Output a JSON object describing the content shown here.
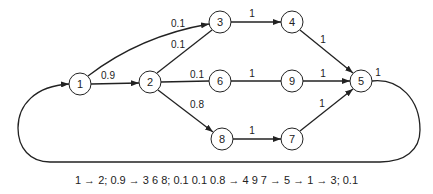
{
  "diagram": {
    "nodes": [
      {
        "id": "1",
        "label": "1",
        "x": 80,
        "y": 84
      },
      {
        "id": "2",
        "label": "2",
        "x": 150,
        "y": 82
      },
      {
        "id": "3",
        "label": "3",
        "x": 220,
        "y": 22
      },
      {
        "id": "4",
        "label": "4",
        "x": 292,
        "y": 22
      },
      {
        "id": "6",
        "label": "6",
        "x": 220,
        "y": 81
      },
      {
        "id": "9",
        "label": "9",
        "x": 292,
        "y": 81
      },
      {
        "id": "5",
        "label": "5",
        "x": 361,
        "y": 81
      },
      {
        "id": "8",
        "label": "8",
        "x": 222,
        "y": 139
      },
      {
        "id": "7",
        "label": "7",
        "x": 292,
        "y": 139
      }
    ],
    "edges": [
      {
        "from": "1",
        "to": "2",
        "weight": "0.9"
      },
      {
        "from": "1",
        "to": "3",
        "weight": "0.1"
      },
      {
        "from": "2",
        "to": "3",
        "weight": "0.1"
      },
      {
        "from": "2",
        "to": "6",
        "weight": "0.1"
      },
      {
        "from": "2",
        "to": "8",
        "weight": "0.8"
      },
      {
        "from": "3",
        "to": "4",
        "weight": "1"
      },
      {
        "from": "4",
        "to": "5",
        "weight": "1"
      },
      {
        "from": "6",
        "to": "9",
        "weight": "1"
      },
      {
        "from": "9",
        "to": "5",
        "weight": "1"
      },
      {
        "from": "8",
        "to": "7",
        "weight": "1"
      },
      {
        "from": "7",
        "to": "5",
        "weight": "1"
      },
      {
        "from": "5",
        "to": "1",
        "weight": "1"
      }
    ],
    "labels": {
      "e_1_3": "0.1",
      "e_2_3": "0.1",
      "e_1_2": "0.9",
      "e_2_6": "0.1",
      "e_2_8": "0.8",
      "e_3_4": "1",
      "e_4_5": "1",
      "e_6_9": "1",
      "e_9_5": "1",
      "e_8_7": "1",
      "e_7_5": "1",
      "e_5_1": "1"
    },
    "caption": "1 → 2; 0.9 → 3 6 8; 0.1 0.1 0.8 → 4 9 7 → 5 → 1 → 3; 0.1"
  }
}
